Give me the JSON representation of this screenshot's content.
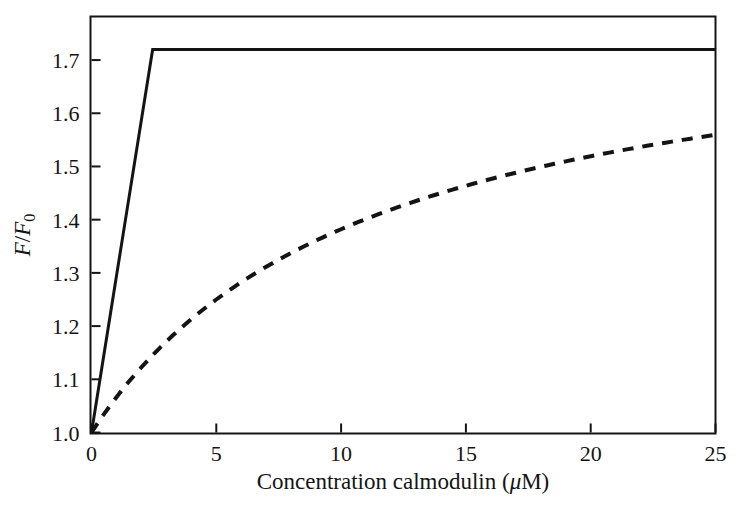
{
  "figure": {
    "background_color": "#ffffff",
    "ink_color": "#141414"
  },
  "chart_data": {
    "type": "line",
    "title": "",
    "subtitle": "",
    "xlabel": "Concentration calmodulin (μM)",
    "xlabel_parts": {
      "text_before": "Concentration calmodulin (",
      "symbol": "μ",
      "text_after": "M)"
    },
    "ylabel": "F/F0",
    "ylabel_parts": {
      "numerator": "F",
      "separator": "/",
      "denominator": "F",
      "subscript": "0"
    },
    "xlim": [
      0,
      25
    ],
    "ylim": [
      1.0,
      1.78
    ],
    "xticks": [
      0,
      5,
      10,
      15,
      20,
      25
    ],
    "xticklabels": [
      "0",
      "5",
      "10",
      "15",
      "20",
      "25"
    ],
    "yticks": [
      1.0,
      1.1,
      1.2,
      1.3,
      1.4,
      1.5,
      1.6,
      1.7
    ],
    "yticklabels": [
      "1.0",
      "1.1",
      "1.2",
      "1.3",
      "1.4",
      "1.5",
      "1.6",
      "1.7"
    ],
    "grid": false,
    "legend": null,
    "frame": "full-box",
    "tick_direction": "in",
    "annotations": [],
    "series": [
      {
        "name": "tight-binding (solid)",
        "style": "solid",
        "color": "#141414",
        "linewidth": 3,
        "saturation_value": 1.72,
        "saturation_x": 2.45,
        "x": [
          0,
          0.5,
          1.0,
          1.5,
          2.0,
          2.45,
          3,
          5,
          7.5,
          10,
          12.5,
          15,
          17.5,
          20,
          22.5,
          25
        ],
        "values": [
          1.0,
          1.147,
          1.294,
          1.441,
          1.588,
          1.72,
          1.72,
          1.72,
          1.72,
          1.72,
          1.72,
          1.72,
          1.72,
          1.72,
          1.72,
          1.72
        ]
      },
      {
        "name": "weak-binding (dashed)",
        "style": "dashed",
        "color": "#141414",
        "linewidth": 4,
        "dash_pattern": "11 9",
        "x": [
          0,
          0.5,
          1,
          1.5,
          2,
          2.5,
          3,
          4,
          5,
          6,
          7,
          8,
          9,
          10,
          11,
          12,
          13,
          14,
          15,
          16,
          17,
          18,
          19,
          20,
          21,
          22,
          23,
          24,
          25
        ],
        "values": [
          1.0,
          1.062,
          1.115,
          1.161,
          1.202,
          1.238,
          1.271,
          1.327,
          1.373,
          1.412,
          1.445,
          1.474,
          1.499,
          1.521,
          1.54,
          1.558,
          1.573,
          1.587,
          1.6,
          1.572,
          1.583,
          1.593,
          1.603,
          1.612,
          1.62,
          1.628,
          1.635,
          1.638,
          1.637
        ]
      }
    ]
  }
}
